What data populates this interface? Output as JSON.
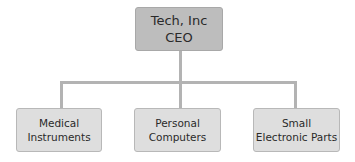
{
  "root": {
    "line1": "Tech, Inc",
    "line2": "CEO"
  },
  "children": [
    {
      "line1": "Medical",
      "line2": "Instruments"
    },
    {
      "line1": "Personal",
      "line2": "Computers"
    },
    {
      "line1": "Small",
      "line2": "Electronic Parts"
    }
  ]
}
